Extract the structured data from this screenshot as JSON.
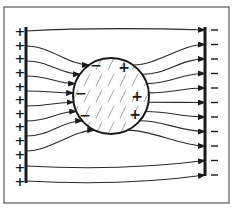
{
  "figure": {
    "left_plate": {
      "charge_symbol": "+",
      "count": 12
    },
    "right_plate": {
      "charge_symbol": "−",
      "count": 11
    },
    "sphere": {
      "hatched": true,
      "induced_charges": [
        {
          "symbol": "−",
          "side": "left",
          "position": "upper"
        },
        {
          "symbol": "−",
          "side": "left",
          "position": "middle"
        },
        {
          "symbol": "−",
          "side": "left",
          "position": "lower"
        },
        {
          "symbol": "+",
          "side": "right",
          "position": "upper"
        },
        {
          "symbol": "+",
          "side": "right",
          "position": "middle"
        },
        {
          "symbol": "+",
          "side": "right",
          "position": "lower"
        }
      ]
    },
    "field_line_count": 11,
    "colors": {
      "ink": "#1a1a1a",
      "background": "#ffffff",
      "frame": "#555555"
    }
  }
}
